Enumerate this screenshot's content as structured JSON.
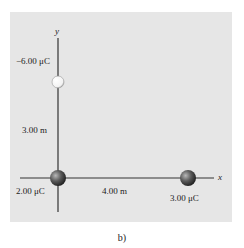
{
  "figure": {
    "caption": "b)",
    "axes": {
      "x_label": "x",
      "y_label": "y"
    },
    "charges": [
      {
        "label": "−6.00 μC",
        "position": "on y-axis, 3.00 m above origin",
        "color": "#ffffff"
      },
      {
        "label": "2.00 μC",
        "position": "origin",
        "color": "#555555"
      },
      {
        "label": "3.00 μC",
        "position": "on x-axis, 4.00 m from origin",
        "color": "#555555"
      }
    ],
    "distances": {
      "vertical": "3.00 m",
      "horizontal": "4.00 m"
    },
    "colors": {
      "panel": "#e6e6e6",
      "axis": "#333333"
    }
  }
}
